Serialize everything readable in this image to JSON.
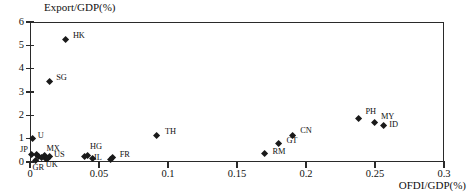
{
  "chart_data": {
    "type": "scatter",
    "title": "",
    "xlabel": "OFDI/GDP(%)",
    "ylabel": "Export/GDP(%)",
    "xlim": [
      0,
      0.3
    ],
    "ylim": [
      0,
      6
    ],
    "xticks": [
      "0",
      "0.05",
      "0.1",
      "0.15",
      "0.2",
      "0.25",
      "0.3"
    ],
    "xtick_values": [
      0,
      0.05,
      0.1,
      0.15,
      0.2,
      0.25,
      0.3
    ],
    "yticks": [
      "0",
      "1",
      "2",
      "3",
      "4",
      "5",
      "6"
    ],
    "ytick_values": [
      0,
      1,
      2,
      3,
      4,
      5,
      6
    ],
    "grid": false,
    "legend": false,
    "marker": "diamond",
    "marker_color": "#1a1a1a",
    "points": [
      {
        "label": "HK",
        "x": 0.026,
        "y": 5.25,
        "lx": 7,
        "ly": -4
      },
      {
        "label": "SG",
        "x": 0.014,
        "y": 3.45,
        "lx": 7,
        "ly": -4
      },
      {
        "label": "U",
        "x": 0.002,
        "y": 1.0,
        "lx": 5,
        "ly": -3
      },
      {
        "label": "TH",
        "x": 0.092,
        "y": 1.15,
        "lx": 8,
        "ly": -3
      },
      {
        "label": "CN",
        "x": 0.19,
        "y": 1.15,
        "lx": 8,
        "ly": -4
      },
      {
        "label": "GT",
        "x": 0.18,
        "y": 0.8,
        "lx": 8,
        "ly": -2
      },
      {
        "label": "RM",
        "x": 0.17,
        "y": 0.37,
        "lx": 8,
        "ly": -1
      },
      {
        "label": "PH",
        "x": 0.238,
        "y": 1.87,
        "lx": 7,
        "ly": -6
      },
      {
        "label": "MY",
        "x": 0.25,
        "y": 1.68,
        "lx": 6,
        "ly": -6
      },
      {
        "label": "ID",
        "x": 0.256,
        "y": 1.54,
        "lx": 6,
        "ly": -1
      },
      {
        "label": "JP",
        "x": 0.0015,
        "y": 0.33,
        "lx": -12,
        "ly": -4
      },
      {
        "label": "GR",
        "x": 0.004,
        "y": 0.04,
        "lx": -3,
        "ly": 7
      },
      {
        "label": "MX",
        "x": 0.0105,
        "y": 0.28,
        "lx": 2,
        "ly": -6
      },
      {
        "label": "US",
        "x": 0.0145,
        "y": 0.22,
        "lx": 4,
        "ly": -2
      },
      {
        "label": "UK",
        "x": 0.0115,
        "y": 0.13,
        "lx": 0,
        "ly": 6
      },
      {
        "label": "",
        "x": 0.0045,
        "y": 0.3,
        "lx": 0,
        "ly": 0
      },
      {
        "label": "",
        "x": 0.0065,
        "y": 0.24,
        "lx": 0,
        "ly": 0
      },
      {
        "label": "",
        "x": 0.0085,
        "y": 0.2,
        "lx": 0,
        "ly": 0
      },
      {
        "label": "",
        "x": 0.0125,
        "y": 0.16,
        "lx": 0,
        "ly": 0
      },
      {
        "label": "HG",
        "x": 0.042,
        "y": 0.28,
        "lx": 2,
        "ly": -8
      },
      {
        "label": "IL",
        "x": 0.045,
        "y": 0.14,
        "lx": 2,
        "ly": -1
      },
      {
        "label": "FR",
        "x": 0.06,
        "y": 0.17,
        "lx": 7,
        "ly": -3
      },
      {
        "label": "",
        "x": 0.0395,
        "y": 0.22,
        "lx": 0,
        "ly": 0
      },
      {
        "label": "",
        "x": 0.0585,
        "y": 0.1,
        "lx": 0,
        "ly": 0
      }
    ]
  }
}
